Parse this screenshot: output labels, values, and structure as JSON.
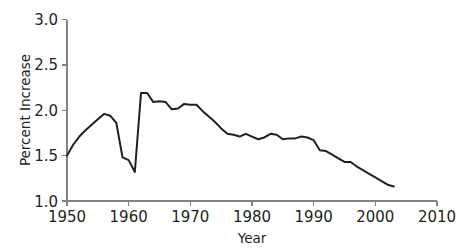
{
  "chart_data": {
    "type": "line",
    "title": "",
    "xlabel": "Year",
    "ylabel": "Percent Increase",
    "xlim": [
      1950,
      2010
    ],
    "ylim": [
      1.0,
      3.0
    ],
    "xticks": [
      1950,
      1960,
      1970,
      1980,
      1990,
      2000,
      2010
    ],
    "xtick_labels": [
      "1950",
      "1960",
      "1970",
      "1980",
      "1990",
      "2000",
      "2010"
    ],
    "yticks": [
      1.0,
      1.5,
      2.0,
      2.5,
      3.0
    ],
    "ytick_labels": [
      "1.0",
      "1.5",
      "2.0",
      "2.5",
      "3.0"
    ],
    "grid": false,
    "legend": null,
    "line_color": "#231f20",
    "axis_color": "#808285",
    "series": [
      {
        "name": "Percent Increase",
        "x": [
          1950,
          1951,
          1952,
          1953,
          1954,
          1955,
          1956,
          1957,
          1958,
          1959,
          1960,
          1961,
          1962,
          1963,
          1964,
          1965,
          1966,
          1967,
          1968,
          1969,
          1970,
          1971,
          1972,
          1973,
          1974,
          1975,
          1976,
          1977,
          1978,
          1979,
          1980,
          1981,
          1982,
          1983,
          1984,
          1985,
          1986,
          1987,
          1988,
          1989,
          1990,
          1991,
          1992,
          1993,
          1994,
          1995,
          1996,
          1997,
          1998,
          1999,
          2000,
          2001,
          2002,
          2003
        ],
        "values": [
          1.5,
          1.62,
          1.71,
          1.78,
          1.84,
          1.9,
          1.96,
          1.94,
          1.86,
          1.48,
          1.45,
          1.32,
          2.19,
          2.19,
          2.09,
          2.1,
          2.09,
          2.01,
          2.02,
          2.07,
          2.06,
          2.06,
          1.99,
          1.93,
          1.87,
          1.8,
          1.74,
          1.73,
          1.71,
          1.74,
          1.71,
          1.68,
          1.7,
          1.74,
          1.73,
          1.68,
          1.69,
          1.69,
          1.71,
          1.7,
          1.67,
          1.56,
          1.55,
          1.51,
          1.47,
          1.43,
          1.43,
          1.38,
          1.34,
          1.3,
          1.26,
          1.22,
          1.18,
          1.16
        ]
      }
    ]
  }
}
